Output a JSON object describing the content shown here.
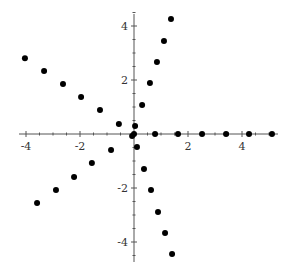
{
  "chart_data": {
    "type": "scatter",
    "title": "",
    "xlabel": "",
    "ylabel": "",
    "xlim": [
      -4.2,
      5.4
    ],
    "ylim": [
      -4.7,
      4.5
    ],
    "grid": false,
    "legend": null,
    "x_ticks": [
      -4,
      -2,
      2,
      4
    ],
    "y_ticks": [
      4,
      2,
      -2,
      -4
    ],
    "x_tick_labels": [
      "-4",
      "-2",
      "2",
      "4"
    ],
    "y_tick_labels": [
      "4",
      "2",
      "-2",
      "-4"
    ],
    "series": [
      {
        "name": "ray-positive-x",
        "points": [
          [
            0.78,
            0
          ],
          [
            1.63,
            0
          ],
          [
            2.52,
            0
          ],
          [
            3.41,
            0
          ],
          [
            4.26,
            0
          ],
          [
            5.11,
            0
          ]
        ]
      },
      {
        "name": "ray-upper-right",
        "points": [
          [
            0.04,
            0.3
          ],
          [
            0.3,
            1.07
          ],
          [
            0.59,
            1.89
          ],
          [
            0.85,
            2.67
          ],
          [
            1.11,
            3.44
          ],
          [
            1.37,
            4.26
          ]
        ]
      },
      {
        "name": "ray-upper-left",
        "points": [
          [
            -0.56,
            0.37
          ],
          [
            -1.26,
            0.89
          ],
          [
            -1.96,
            1.37
          ],
          [
            -2.63,
            1.85
          ],
          [
            -3.33,
            2.33
          ],
          [
            -4.04,
            2.81
          ]
        ]
      },
      {
        "name": "ray-lower-left",
        "points": [
          [
            -0.85,
            -0.59
          ],
          [
            -1.56,
            -1.07
          ],
          [
            -2.22,
            -1.59
          ],
          [
            -2.89,
            -2.07
          ],
          [
            -3.59,
            -2.56
          ]
        ]
      },
      {
        "name": "ray-lower-right",
        "points": [
          [
            0.11,
            -0.48
          ],
          [
            0.37,
            -1.3
          ],
          [
            0.63,
            -2.07
          ],
          [
            0.89,
            -2.89
          ],
          [
            1.15,
            -3.67
          ],
          [
            1.41,
            -4.44
          ]
        ]
      },
      {
        "name": "origin-cluster",
        "points": [
          [
            0.0,
            0.0
          ],
          [
            -0.07,
            -0.07
          ]
        ]
      }
    ]
  },
  "style": {
    "point_color": "#000000",
    "axis_color": "#555555",
    "label_color": "#333333"
  }
}
